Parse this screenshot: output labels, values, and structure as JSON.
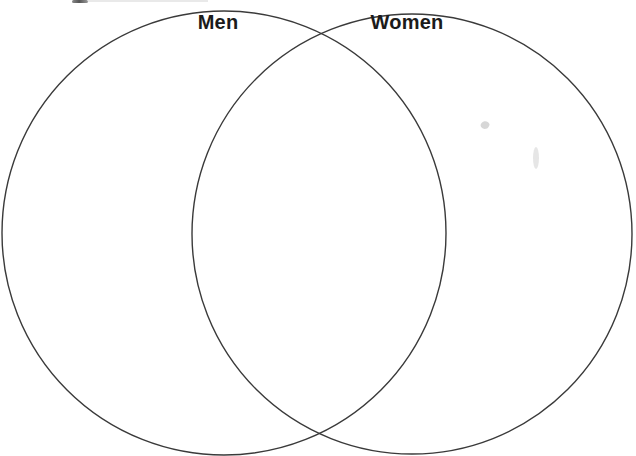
{
  "diagram": {
    "type": "venn",
    "sets": [
      {
        "label": "Men"
      },
      {
        "label": "Women"
      }
    ],
    "line_color": "#3a3a3a",
    "label_color": "#1b1b1b",
    "background_color": "#ffffff"
  }
}
